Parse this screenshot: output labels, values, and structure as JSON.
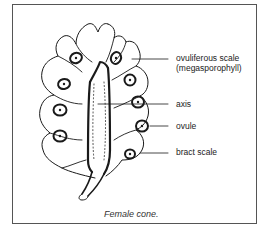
{
  "figure": {
    "caption": "Female cone.",
    "labels": [
      {
        "id": "ovuliferous-scale",
        "line1": "ovuliferous scale",
        "line2": "(megasporophyll)"
      },
      {
        "id": "axis",
        "line1": "axis"
      },
      {
        "id": "ovule",
        "line1": "ovule"
      },
      {
        "id": "bract-scale",
        "line1": "bract scale"
      }
    ]
  },
  "colors": {
    "ink": "#1a1a1a",
    "frame": "#555555",
    "background": "#ffffff"
  }
}
